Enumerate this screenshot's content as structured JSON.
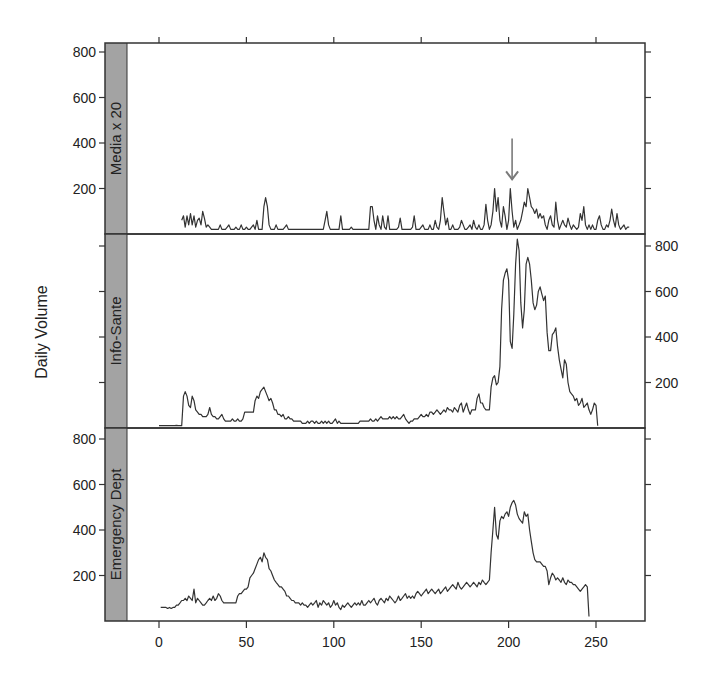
{
  "chart_data": {
    "type": "line",
    "layout": "lattice-3-panel-stacked",
    "ylabel": "Daily Volume",
    "xlabel": "",
    "xlim": [
      -20,
      280
    ],
    "ylim": [
      0,
      850
    ],
    "x_ticks": [
      0,
      50,
      100,
      150,
      200,
      250
    ],
    "y_ticks": [
      200,
      400,
      600,
      800
    ],
    "grid": false,
    "legend": null,
    "strip_color": "#a3a3a3",
    "line_color": "#333333",
    "annotation": {
      "type": "arrow",
      "x": 202,
      "color": "#7a7a7a",
      "panel": "Media x 20",
      "from_y": 420,
      "to_y": 240
    },
    "panels": [
      {
        "name": "Media x 20",
        "y_axis_side": "left",
        "x_start": 13,
        "values": [
          60,
          80,
          30,
          80,
          40,
          90,
          40,
          80,
          30,
          60,
          70,
          40,
          100,
          70,
          30,
          40,
          30,
          20,
          20,
          20,
          20,
          20,
          40,
          20,
          20,
          20,
          30,
          40,
          20,
          20,
          20,
          30,
          20,
          20,
          40,
          20,
          20,
          30,
          20,
          20,
          30,
          40,
          20,
          60,
          20,
          20,
          20,
          120,
          160,
          120,
          40,
          20,
          20,
          20,
          40,
          20,
          20,
          20,
          20,
          30,
          40,
          20,
          20,
          20,
          20,
          20,
          20,
          20,
          20,
          20,
          20,
          20,
          20,
          20,
          20,
          20,
          20,
          20,
          20,
          20,
          20,
          20,
          60,
          100,
          40,
          20,
          20,
          20,
          20,
          20,
          20,
          80,
          20,
          20,
          20,
          20,
          20,
          30,
          20,
          20,
          20,
          20,
          20,
          20,
          20,
          20,
          20,
          20,
          120,
          120,
          60,
          20,
          80,
          40,
          20,
          80,
          30,
          20,
          80,
          20,
          20,
          20,
          20,
          20,
          30,
          70,
          20,
          20,
          20,
          20,
          20,
          20,
          30,
          80,
          20,
          20,
          20,
          30,
          40,
          20,
          20,
          20,
          40,
          20,
          20,
          60,
          30,
          20,
          60,
          160,
          100,
          40,
          70,
          20,
          20,
          40,
          20,
          20,
          20,
          30,
          60,
          40,
          20,
          20,
          30,
          40,
          20,
          60,
          30,
          20,
          40,
          20,
          20,
          40,
          130,
          60,
          20,
          40,
          100,
          200,
          100,
          160,
          60,
          30,
          120,
          80,
          20,
          60,
          200,
          100,
          30,
          60,
          20,
          40,
          60,
          100,
          140,
          120,
          200,
          160,
          120,
          110,
          90,
          110,
          70,
          90,
          70,
          80,
          40,
          20,
          60,
          80,
          40,
          30,
          140,
          60,
          20,
          40,
          60,
          40,
          30,
          70,
          40,
          20,
          40,
          30,
          20,
          30,
          90,
          60,
          120,
          40,
          20,
          40,
          20,
          40,
          20,
          20,
          60,
          80,
          40,
          20,
          20,
          40,
          30,
          60,
          110,
          60,
          30,
          90,
          40,
          20,
          30,
          40,
          20,
          30,
          30
        ]
      },
      {
        "name": "Info-Sante",
        "y_axis_side": "right",
        "x_start": 0,
        "values": [
          10,
          10,
          10,
          10,
          10,
          10,
          10,
          10,
          10,
          10,
          12,
          10,
          10,
          10,
          140,
          160,
          140,
          100,
          90,
          140,
          120,
          80,
          70,
          60,
          60,
          50,
          50,
          50,
          60,
          90,
          60,
          50,
          50,
          40,
          40,
          50,
          60,
          40,
          30,
          30,
          30,
          30,
          40,
          30,
          30,
          40,
          30,
          30,
          40,
          70,
          70,
          70,
          70,
          70,
          70,
          120,
          140,
          130,
          160,
          170,
          180,
          160,
          140,
          120,
          130,
          110,
          80,
          80,
          60,
          60,
          50,
          60,
          40,
          40,
          50,
          40,
          40,
          30,
          30,
          30,
          30,
          30,
          20,
          20,
          20,
          30,
          20,
          30,
          30,
          20,
          30,
          20,
          20,
          30,
          20,
          30,
          20,
          30,
          20,
          20,
          30,
          40,
          20,
          30,
          20,
          20,
          20,
          20,
          20,
          20,
          20,
          20,
          20,
          20,
          20,
          30,
          30,
          30,
          30,
          30,
          30,
          40,
          30,
          30,
          40,
          30,
          40,
          50,
          40,
          40,
          40,
          40,
          50,
          40,
          50,
          40,
          50,
          40,
          40,
          50,
          60,
          40,
          30,
          20,
          30,
          30,
          40,
          40,
          40,
          50,
          60,
          50,
          50,
          60,
          50,
          70,
          70,
          60,
          70,
          80,
          70,
          60,
          70,
          80,
          70,
          90,
          80,
          80,
          70,
          90,
          80,
          70,
          100,
          110,
          70,
          90,
          110,
          80,
          60,
          80,
          80,
          80,
          130,
          150,
          110,
          110,
          90,
          80,
          80,
          80,
          180,
          220,
          230,
          190,
          200,
          270,
          520,
          650,
          680,
          700,
          650,
          380,
          350,
          500,
          720,
          830,
          780,
          550,
          440,
          520,
          720,
          750,
          720,
          650,
          550,
          520,
          540,
          600,
          620,
          590,
          560,
          580,
          420,
          340,
          340,
          410,
          420,
          440,
          360,
          300,
          260,
          220,
          300,
          280,
          200,
          160,
          150,
          140,
          120,
          130,
          100,
          110,
          130,
          90,
          100,
          110,
          80,
          60,
          80,
          110,
          100,
          10
        ]
      },
      {
        "name": "Emergency Dept",
        "y_axis_side": "left",
        "x_start": 1,
        "values": [
          60,
          60,
          60,
          60,
          55,
          60,
          55,
          60,
          60,
          70,
          70,
          80,
          90,
          90,
          100,
          90,
          110,
          100,
          90,
          140,
          80,
          100,
          90,
          80,
          70,
          70,
          80,
          90,
          100,
          90,
          110,
          90,
          100,
          120,
          110,
          90,
          80,
          80,
          80,
          80,
          80,
          80,
          80,
          80,
          110,
          120,
          120,
          130,
          140,
          140,
          150,
          190,
          200,
          210,
          230,
          250,
          270,
          280,
          260,
          300,
          280,
          270,
          230,
          220,
          200,
          180,
          170,
          160,
          150,
          150,
          140,
          130,
          110,
          110,
          100,
          90,
          90,
          80,
          80,
          80,
          70,
          80,
          70,
          70,
          60,
          70,
          80,
          70,
          80,
          90,
          60,
          80,
          70,
          90,
          80,
          70,
          80,
          60,
          70,
          90,
          70,
          80,
          60,
          50,
          70,
          60,
          70,
          80,
          70,
          60,
          70,
          80,
          70,
          80,
          70,
          90,
          70,
          70,
          80,
          90,
          80,
          90,
          100,
          80,
          70,
          90,
          100,
          90,
          80,
          100,
          90,
          110,
          100,
          90,
          80,
          90,
          110,
          90,
          100,
          110,
          120,
          100,
          110,
          100,
          110,
          100,
          120,
          130,
          120,
          110,
          120,
          130,
          140,
          120,
          130,
          140,
          130,
          120,
          130,
          140,
          120,
          130,
          140,
          150,
          130,
          140,
          150,
          160,
          150,
          140,
          170,
          150,
          140,
          150,
          160,
          170,
          160,
          150,
          160,
          170,
          160,
          150,
          170,
          160,
          180,
          170,
          160,
          170,
          180,
          300,
          400,
          500,
          380,
          360,
          440,
          460,
          450,
          470,
          480,
          460,
          500,
          520,
          530,
          510,
          470,
          450,
          440,
          430,
          480,
          460,
          470,
          400,
          350,
          300,
          270,
          260,
          260,
          260,
          250,
          240,
          240,
          220,
          160,
          190,
          210,
          200,
          180,
          190,
          180,
          170,
          190,
          170,
          160,
          180,
          170,
          170,
          160,
          160,
          150,
          140,
          130,
          140,
          150,
          160,
          150,
          20
        ]
      }
    ]
  },
  "text": {
    "ylabel": "Daily Volume",
    "panel_labels": [
      "Media x 20",
      "Info-Sante",
      "Emergency Dept"
    ],
    "x_tick_labels": [
      "0",
      "50",
      "100",
      "150",
      "200",
      "250"
    ],
    "y_tick_labels": [
      "200",
      "400",
      "600",
      "800"
    ]
  }
}
